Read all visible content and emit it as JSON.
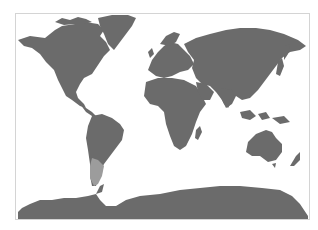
{
  "map": {
    "type": "world-distribution-map",
    "projection": "equirectangular",
    "colors": {
      "background": "#ffffff",
      "frame": "#d4d4d4",
      "land": "#6b6b6b",
      "highlight": "#9c9c9c"
    },
    "highlighted_region": {
      "name": "southern Chile / Patagonia",
      "continent": "South America"
    },
    "regions": [
      "North America",
      "Greenland",
      "South America",
      "Europe",
      "Africa",
      "Asia",
      "Australia",
      "New Zealand",
      "Antarctica"
    ]
  }
}
